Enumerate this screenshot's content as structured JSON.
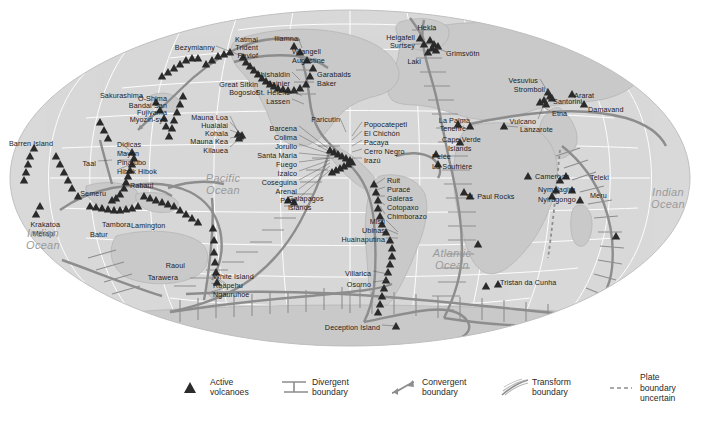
{
  "figure": {
    "type": "world-map",
    "projection": "mollweide-oval",
    "colors": {
      "ocean": "#d9d9d9",
      "land": "#c9c9c9",
      "graticule": "#ffffff",
      "plate_boundary": "#8d8d8d",
      "volcano": "#2b2b2b",
      "label": "#1c1c1c",
      "ocean_label": "#9a9a9a",
      "background": "#ffffff"
    }
  },
  "ocean_labels": [
    {
      "name": "Pacific Ocean",
      "text": "Pacific\nOcean",
      "x": 223,
      "y": 172
    },
    {
      "name": "Atlantic Ocean",
      "text": "Atlantic\nOcean",
      "x": 452,
      "y": 247
    },
    {
      "name": "Indian Ocean West",
      "text": "Indian\nOcean",
      "x": 43,
      "y": 227
    },
    {
      "name": "Indian Ocean East",
      "text": "Indian\nOcean",
      "x": 668,
      "y": 186
    }
  ],
  "volcano_labels": [
    {
      "label": "Bezymianny",
      "x": 215,
      "y": 44,
      "align": "r"
    },
    {
      "label": "Sakurashima",
      "x": 143,
      "y": 92,
      "align": "r"
    },
    {
      "label": "O-Shima",
      "x": 167,
      "y": 95,
      "align": "r"
    },
    {
      "label": "Bandai San",
      "x": 167,
      "y": 102,
      "align": "r"
    },
    {
      "label": "Fujiyama",
      "x": 167,
      "y": 109,
      "align": "r"
    },
    {
      "label": "Myozin-syo",
      "x": 167,
      "y": 116,
      "align": "r"
    },
    {
      "label": "Great Sitkin",
      "x": 258,
      "y": 81,
      "align": "r"
    },
    {
      "label": "Bogoslof",
      "x": 258,
      "y": 89,
      "align": "r"
    },
    {
      "label": "Katmai",
      "x": 258,
      "y": 36,
      "align": "r"
    },
    {
      "label": "Trident",
      "x": 258,
      "y": 44,
      "align": "r"
    },
    {
      "label": "Pavlof",
      "x": 258,
      "y": 52,
      "align": "r"
    },
    {
      "label": "Iliamna",
      "x": 298,
      "y": 35,
      "align": "r"
    },
    {
      "label": "Wrangell",
      "x": 292,
      "y": 48,
      "align": "l"
    },
    {
      "label": "Augustine",
      "x": 292,
      "y": 57,
      "align": "l"
    },
    {
      "label": "Shishaldin",
      "x": 290,
      "y": 71,
      "align": "r"
    },
    {
      "label": "Rainier",
      "x": 290,
      "y": 80,
      "align": "r"
    },
    {
      "label": "St. Helens",
      "x": 290,
      "y": 89,
      "align": "r"
    },
    {
      "label": "Lassen",
      "x": 290,
      "y": 98,
      "align": "r"
    },
    {
      "label": "Garabalds",
      "x": 317,
      "y": 71,
      "align": "l"
    },
    {
      "label": "Baker",
      "x": 317,
      "y": 80,
      "align": "l"
    },
    {
      "label": "Mauna Loa",
      "x": 228,
      "y": 114,
      "align": "r"
    },
    {
      "label": "Hualalai",
      "x": 228,
      "y": 122,
      "align": "r"
    },
    {
      "label": "Kohala",
      "x": 228,
      "y": 130,
      "align": "r"
    },
    {
      "label": "Mauna Kea",
      "x": 228,
      "y": 138,
      "align": "r"
    },
    {
      "label": "Kilauea",
      "x": 228,
      "y": 147,
      "align": "r"
    },
    {
      "label": "Barren Island",
      "x": 53,
      "y": 140,
      "align": "r"
    },
    {
      "label": "Didicas",
      "x": 117,
      "y": 141,
      "align": "l"
    },
    {
      "label": "Mayon",
      "x": 117,
      "y": 150,
      "align": "l"
    },
    {
      "label": "Pinatubo",
      "x": 117,
      "y": 159,
      "align": "l"
    },
    {
      "label": "Hibok Hibok",
      "x": 117,
      "y": 168,
      "align": "l"
    },
    {
      "label": "Taal",
      "x": 96,
      "y": 160,
      "align": "r"
    },
    {
      "label": "Semeru",
      "x": 106,
      "y": 190,
      "align": "r"
    },
    {
      "label": "Rabaul",
      "x": 130,
      "y": 182,
      "align": "l"
    },
    {
      "label": "Krakatoa",
      "x": 60,
      "y": 221,
      "align": "r"
    },
    {
      "label": "Merapi",
      "x": 55,
      "y": 230,
      "align": "r"
    },
    {
      "label": "Tambora",
      "x": 102,
      "y": 221,
      "align": "l"
    },
    {
      "label": "Batur",
      "x": 90,
      "y": 231,
      "align": "l"
    },
    {
      "label": "Lamington",
      "x": 131,
      "y": 222,
      "align": "l"
    },
    {
      "label": "Raoul",
      "x": 185,
      "y": 262,
      "align": "r"
    },
    {
      "label": "Tarawera",
      "x": 178,
      "y": 274,
      "align": "r"
    },
    {
      "label": "White Island",
      "x": 213,
      "y": 273,
      "align": "l"
    },
    {
      "label": "Ruapehu",
      "x": 213,
      "y": 282,
      "align": "l"
    },
    {
      "label": "Ngauruhoe",
      "x": 213,
      "y": 291,
      "align": "l"
    },
    {
      "label": "Paricutin",
      "x": 340,
      "y": 116,
      "align": "r"
    },
    {
      "label": "Popocatepetl",
      "x": 364,
      "y": 121,
      "align": "l"
    },
    {
      "label": "El Chichón",
      "x": 364,
      "y": 130,
      "align": "l"
    },
    {
      "label": "Pacaya",
      "x": 364,
      "y": 139,
      "align": "l"
    },
    {
      "label": "Cerro Negro",
      "x": 364,
      "y": 148,
      "align": "l"
    },
    {
      "label": "Irazú",
      "x": 364,
      "y": 157,
      "align": "l"
    },
    {
      "label": "Barcena",
      "x": 297,
      "y": 125,
      "align": "r"
    },
    {
      "label": "Colima",
      "x": 297,
      "y": 134,
      "align": "r"
    },
    {
      "label": "Jorullo",
      "x": 297,
      "y": 143,
      "align": "r"
    },
    {
      "label": "Santa Maria",
      "x": 297,
      "y": 152,
      "align": "r"
    },
    {
      "label": "Fuego",
      "x": 297,
      "y": 161,
      "align": "r"
    },
    {
      "label": "Izalco",
      "x": 297,
      "y": 170,
      "align": "r"
    },
    {
      "label": "Coseguina",
      "x": 297,
      "y": 179,
      "align": "r"
    },
    {
      "label": "Arenal",
      "x": 297,
      "y": 188,
      "align": "r"
    },
    {
      "label": "Poas",
      "x": 297,
      "y": 197,
      "align": "r"
    },
    {
      "label": "Galapagos",
      "x": 288,
      "y": 195,
      "align": "l"
    },
    {
      "label": "Islands",
      "x": 288,
      "y": 204,
      "align": "l"
    },
    {
      "label": "Ruit",
      "x": 387,
      "y": 177,
      "align": "l"
    },
    {
      "label": "Puracé",
      "x": 387,
      "y": 186,
      "align": "l"
    },
    {
      "label": "Galeras",
      "x": 387,
      "y": 195,
      "align": "l"
    },
    {
      "label": "Cotopaxo",
      "x": 387,
      "y": 204,
      "align": "l"
    },
    {
      "label": "Chimborazo",
      "x": 387,
      "y": 213,
      "align": "l"
    },
    {
      "label": "Misti",
      "x": 385,
      "y": 218,
      "align": "r"
    },
    {
      "label": "Ubinas",
      "x": 385,
      "y": 227,
      "align": "r"
    },
    {
      "label": "Huainaputina",
      "x": 385,
      "y": 236,
      "align": "r"
    },
    {
      "label": "Villarica",
      "x": 371,
      "y": 270,
      "align": "r"
    },
    {
      "label": "Osorno",
      "x": 371,
      "y": 281,
      "align": "r"
    },
    {
      "label": "Deception Island",
      "x": 380,
      "y": 324,
      "align": "r"
    },
    {
      "label": "Hekla",
      "x": 427,
      "y": 24,
      "align": "c"
    },
    {
      "label": "Helgafell",
      "x": 415,
      "y": 34,
      "align": "r"
    },
    {
      "label": "Surtsey",
      "x": 415,
      "y": 42,
      "align": "r"
    },
    {
      "label": "Laki",
      "x": 421,
      "y": 58,
      "align": "r"
    },
    {
      "label": "Grimsvötn",
      "x": 446,
      "y": 50,
      "align": "l"
    },
    {
      "label": "Vesuvius",
      "x": 538,
      "y": 77,
      "align": "r"
    },
    {
      "label": "Stromboli",
      "x": 545,
      "y": 86,
      "align": "r"
    },
    {
      "label": "Santorini",
      "x": 553,
      "y": 98,
      "align": "l"
    },
    {
      "label": "Etna",
      "x": 552,
      "y": 110,
      "align": "l"
    },
    {
      "label": "Vulcano",
      "x": 536,
      "y": 118,
      "align": "r"
    },
    {
      "label": "Ararat",
      "x": 574,
      "y": 92,
      "align": "l"
    },
    {
      "label": "Damavand",
      "x": 588,
      "y": 106,
      "align": "l"
    },
    {
      "label": "La Palma",
      "x": 470,
      "y": 117,
      "align": "r"
    },
    {
      "label": "Tenerife",
      "x": 466,
      "y": 125,
      "align": "r"
    },
    {
      "label": "Lanzarote",
      "x": 520,
      "y": 126,
      "align": "l"
    },
    {
      "label": "Cape Verde",
      "x": 442,
      "y": 136,
      "align": "l"
    },
    {
      "label": "Islands",
      "x": 448,
      "y": 145,
      "align": "l"
    },
    {
      "label": "Pelée",
      "x": 432,
      "y": 153,
      "align": "l"
    },
    {
      "label": "La Soufrière",
      "x": 432,
      "y": 163,
      "align": "l"
    },
    {
      "label": "St. Paul Rocks",
      "x": 466,
      "y": 193,
      "align": "l"
    },
    {
      "label": "Cameroon",
      "x": 535,
      "y": 173,
      "align": "l"
    },
    {
      "label": "Nymalagira",
      "x": 538,
      "y": 186,
      "align": "l"
    },
    {
      "label": "Nyiragongo",
      "x": 538,
      "y": 196,
      "align": "l"
    },
    {
      "label": "Teleki",
      "x": 590,
      "y": 174,
      "align": "l"
    },
    {
      "label": "Meru",
      "x": 590,
      "y": 192,
      "align": "l"
    },
    {
      "label": "Tristan da Cunha",
      "x": 500,
      "y": 279,
      "align": "l"
    }
  ],
  "legend": {
    "items": [
      {
        "name": "active-volcanoes",
        "symbol": "volcano-triangle",
        "text": "Active\nvolcanoes",
        "x": 178
      },
      {
        "name": "divergent-boundary",
        "symbol": "divergent-lines",
        "text": "Divergent\nboundary",
        "x": 280
      },
      {
        "name": "convergent-boundary",
        "symbol": "convergent-barbs",
        "text": "Convergent\nboundary",
        "x": 390
      },
      {
        "name": "transform-boundary",
        "symbol": "transform-hatch",
        "text": "Transform\nboundary",
        "x": 500
      },
      {
        "name": "plate-boundary-uncertain",
        "symbol": "dashed-line",
        "text": "Plate\nboundary\nuncertain",
        "x": 608
      }
    ]
  }
}
